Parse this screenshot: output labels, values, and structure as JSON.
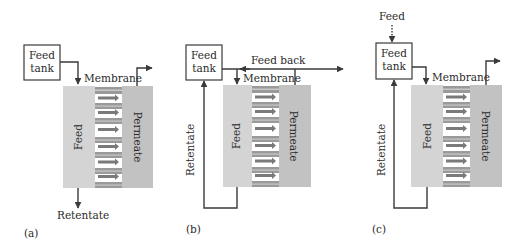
{
  "figure": {
    "colors": {
      "feed_region": "#d4d4d4",
      "permeate_region": "#c2c2c2",
      "membrane_bar": "#9a9a9a",
      "membrane_bar_stripe": "#c8c8c8",
      "arrow": "#7a7a7a",
      "line": "#3a3a3a"
    },
    "panels": [
      {
        "id": "a",
        "label": "(a)",
        "tank_label_line1": "Feed",
        "tank_label_line2": "tank",
        "membrane_label": "Membrane",
        "feed_label": "Feed",
        "permeate_label": "Permeate",
        "retentate_label": "Retentate"
      },
      {
        "id": "b",
        "label": "(b)",
        "tank_label_line1": "Feed",
        "tank_label_line2": "tank",
        "membrane_label": "Membrane",
        "feed_label": "Feed",
        "permeate_label": "Permeate",
        "retentate_label": "Retentate",
        "feedback_label": "Feed back"
      },
      {
        "id": "c",
        "label": "(c)",
        "tank_label_line1": "Feed",
        "tank_label_line2": "tank",
        "membrane_label": "Membrane",
        "feed_label": "Feed",
        "permeate_label": "Permeate",
        "retentate_label": "Retentate",
        "feed_in_label": "Feed"
      }
    ]
  }
}
